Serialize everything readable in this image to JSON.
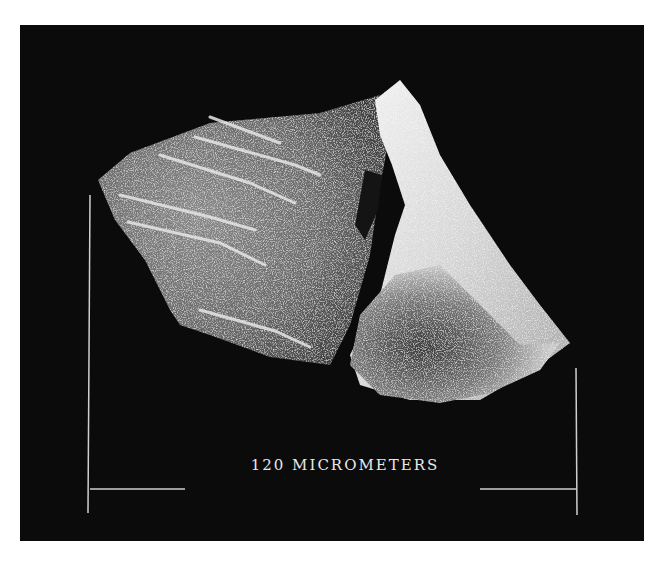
{
  "image": {
    "description": "Scanning electron micrograph of a small grain/fragment with diagonal ridges on a black background",
    "background_color": "#0b0b0b",
    "page_color": "#ffffff"
  },
  "scale_bar": {
    "label": "120 MICROMETERS",
    "value": 120,
    "unit": "micrometers",
    "color": "#d8d8d8"
  }
}
